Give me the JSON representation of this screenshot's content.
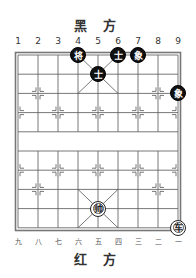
{
  "header": {
    "title": "黑 方"
  },
  "footer": {
    "title": "红 方"
  },
  "columns_top": [
    "1",
    "2",
    "3",
    "4",
    "5",
    "6",
    "7",
    "8",
    "9"
  ],
  "columns_bottom": [
    "九",
    "八",
    "七",
    "六",
    "五",
    "四",
    "三",
    "二",
    "一"
  ],
  "board": {
    "files": 9,
    "ranks": 10,
    "line_color": "#555555",
    "frame_color": "#666666"
  },
  "pieces": [
    {
      "side": "black",
      "label": "将",
      "name": "black-general",
      "col": 4,
      "row": 0
    },
    {
      "side": "black",
      "label": "士",
      "name": "black-advisor",
      "col": 6,
      "row": 0
    },
    {
      "side": "black",
      "label": "象",
      "name": "black-elephant",
      "col": 7,
      "row": 0
    },
    {
      "side": "black",
      "label": "士",
      "name": "black-advisor",
      "col": 5,
      "row": 1
    },
    {
      "side": "black",
      "label": "象",
      "name": "black-elephant",
      "col": 9,
      "row": 2
    },
    {
      "side": "red",
      "label": "帅",
      "name": "red-general",
      "col": 5,
      "row": 8
    },
    {
      "side": "red",
      "label": "车",
      "name": "red-chariot",
      "col": 9,
      "row": 9
    }
  ]
}
